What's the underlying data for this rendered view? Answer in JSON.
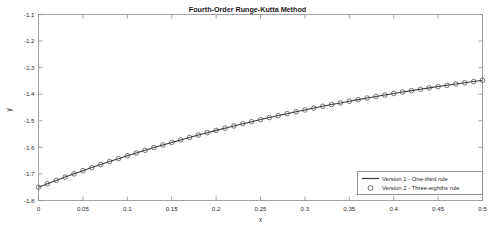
{
  "chart_data": {
    "type": "line",
    "title": "Fourth-Order Runge-Kutta Method",
    "xlabel": "x",
    "ylabel": "y",
    "xlim": [
      0,
      0.5
    ],
    "ylim": [
      -1.8,
      -1.1
    ],
    "grid": false,
    "legend_position": "lower right",
    "xticks": [
      "0",
      "0.05",
      "0.1",
      "0.15",
      "0.2",
      "0.25",
      "0.3",
      "0.35",
      "0.4",
      "0.45",
      "0.5"
    ],
    "xtick_values": [
      0,
      0.05,
      0.1,
      0.15,
      0.2,
      0.25,
      0.3,
      0.35,
      0.4,
      0.45,
      0.5
    ],
    "yticks": [
      "-1.1",
      "-1.2",
      "-1.3",
      "-1.4",
      "-1.5",
      "-1.6",
      "-1.7",
      "-1.8"
    ],
    "ytick_values": [
      -1.1,
      -1.2,
      -1.3,
      -1.4,
      -1.5,
      -1.6,
      -1.7,
      -1.8
    ],
    "x": [
      0,
      0.01,
      0.02,
      0.03,
      0.04,
      0.05,
      0.06,
      0.07,
      0.08,
      0.09,
      0.1,
      0.11,
      0.12,
      0.13,
      0.14,
      0.15,
      0.16,
      0.17,
      0.18,
      0.19,
      0.2,
      0.21,
      0.22,
      0.23,
      0.24,
      0.25,
      0.26,
      0.27,
      0.28,
      0.29,
      0.3,
      0.31,
      0.32,
      0.33,
      0.34,
      0.35,
      0.36,
      0.37,
      0.38,
      0.39,
      0.4,
      0.41,
      0.42,
      0.43,
      0.44,
      0.45,
      0.46,
      0.47,
      0.48,
      0.49,
      0.5
    ],
    "series": [
      {
        "name": "Version 1 - One-third rule",
        "style": "line",
        "values": [
          -1.75,
          -1.737,
          -1.7243,
          -1.7119,
          -1.6997,
          -1.6878,
          -1.6761,
          -1.6647,
          -1.6535,
          -1.6425,
          -1.6318,
          -1.6213,
          -1.611,
          -1.6009,
          -1.5911,
          -1.5814,
          -1.572,
          -1.5627,
          -1.5537,
          -1.5448,
          -1.5361,
          -1.5277,
          -1.5194,
          -1.5112,
          -1.5033,
          -1.4955,
          -1.4879,
          -1.4805,
          -1.4732,
          -1.4661,
          -1.4591,
          -1.4523,
          -1.4456,
          -1.4391,
          -1.4327,
          -1.4265,
          -1.4204,
          -1.4144,
          -1.4086,
          -1.4029,
          -1.3973,
          -1.3918,
          -1.3865,
          -1.3813,
          -1.3762,
          -1.3712,
          -1.3663,
          -1.3615,
          -1.3568,
          -1.3523,
          -1.3478
        ]
      },
      {
        "name": "Version 2 - Three-eighths rule",
        "style": "marker",
        "values": [
          -1.75,
          -1.737,
          -1.7243,
          -1.7119,
          -1.6997,
          -1.6878,
          -1.6761,
          -1.6647,
          -1.6535,
          -1.6425,
          -1.6318,
          -1.6213,
          -1.611,
          -1.6009,
          -1.5911,
          -1.5814,
          -1.572,
          -1.5627,
          -1.5537,
          -1.5448,
          -1.5361,
          -1.5277,
          -1.5194,
          -1.5112,
          -1.5033,
          -1.4955,
          -1.4879,
          -1.4805,
          -1.4732,
          -1.4661,
          -1.4591,
          -1.4523,
          -1.4456,
          -1.4391,
          -1.4327,
          -1.4265,
          -1.4204,
          -1.4144,
          -1.4086,
          -1.4029,
          -1.3973,
          -1.3918,
          -1.3865,
          -1.3813,
          -1.3762,
          -1.3712,
          -1.3663,
          -1.3615,
          -1.3568,
          -1.3523,
          -1.3478
        ]
      }
    ]
  },
  "legend": {
    "entries": [
      {
        "label": "Version 1 - One-third rule",
        "marker": "line"
      },
      {
        "label": "Version 2 - Three-eighths rule",
        "marker": "circle"
      }
    ]
  }
}
